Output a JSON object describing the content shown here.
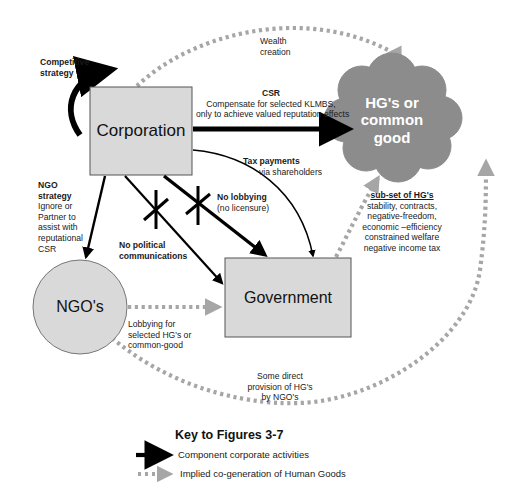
{
  "nodes": {
    "corporation": "Corporation",
    "government": "Government",
    "ngo": "NGO's",
    "common_good": [
      "HG's or",
      "common",
      "good"
    ]
  },
  "labels": {
    "competitive_strategy": [
      "Competitive",
      "strategy"
    ],
    "wealth_creation": [
      "Wealth",
      "creation"
    ],
    "csr_title": "CSR",
    "csr_desc": [
      "Compensate for selected  KLMBS,",
      "only to achieve valued reputation  effects"
    ],
    "tax_title": "Tax  payments",
    "tax_desc": "via shareholders",
    "ngo_strategy_title": [
      "NGO",
      "strategy"
    ],
    "ngo_strategy_desc": [
      "Ignore or",
      "Partner to",
      "assist with",
      "reputational",
      "CSR"
    ],
    "no_lobbying": "No lobbying",
    "no_licensure": "(no licensure)",
    "no_political": [
      "No political",
      "communications"
    ],
    "subset_title": "sub-set of HG's",
    "subset_items": [
      "stability, contracts,",
      "negative-freedom,",
      "economic –efficiency",
      "constrained  welfare",
      "negative income tax"
    ],
    "ngo_lobbying": [
      "Lobbying  for",
      "selected HG's  or",
      "common-good"
    ],
    "direct_provision": [
      "Some direct",
      "provision of HG's",
      "by NGO's"
    ]
  },
  "key": {
    "title": "Key to Figures 3-7",
    "items": [
      {
        "type": "solid-arrow",
        "label": "Component corporate activities"
      },
      {
        "type": "dotted-arrow",
        "label": "Implied co-generation of Human Goods"
      }
    ]
  },
  "colors": {
    "box_fill": "#d9d9d9",
    "box_stroke": "#555555",
    "cloud_fill": "#8c8c8c",
    "dotted": "#a6a6a6",
    "solid": "#000000"
  }
}
